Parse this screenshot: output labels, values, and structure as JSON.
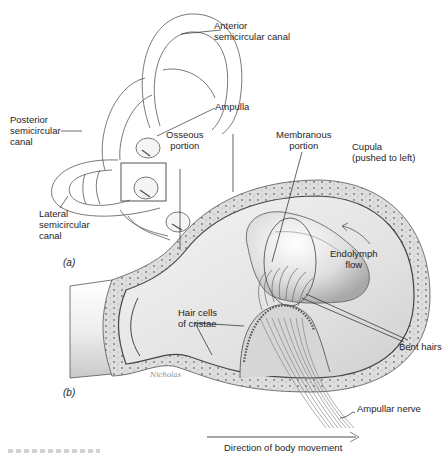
{
  "figure": {
    "type": "anatomical-illustration",
    "colors": {
      "line": "#555555",
      "shading": "#bdbdbd",
      "bone_fill": "#dcdcdc",
      "background": "#ffffff",
      "arrow": "#8a8a8a"
    }
  },
  "panel_a": {
    "tag": "(a)",
    "labels": {
      "anterior_line1": "Anterior",
      "anterior_line2": "semicircular canal",
      "ampulla": "Ampulla",
      "posterior_line1": "Posterior",
      "posterior_line2": "semicircular",
      "posterior_line3": "canal",
      "lateral_line1": "Lateral",
      "lateral_line2": "semicircular",
      "lateral_line3": "canal"
    }
  },
  "panel_b": {
    "tag": "(b)",
    "labels": {
      "osseous_line1": "Osseous",
      "osseous_line2": "portion",
      "membranous_line1": "Membranous",
      "membranous_line2": "portion",
      "cupula_line1": "Cupula",
      "cupula_line2": "(pushed to left)",
      "endolymph_line1": "Endolymph",
      "endolymph_line2": "flow",
      "hair_cells_line1": "Hair cells",
      "hair_cells_line2": "of cristae",
      "bent_hairs": "Bent hairs",
      "ampullar_nerve": "Ampullar nerve"
    },
    "arrow_caption": "Direction of body movement",
    "signature": "Nicholas"
  }
}
